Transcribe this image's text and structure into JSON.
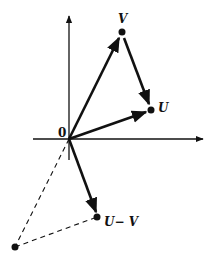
{
  "diagram": {
    "origin_label": "0",
    "points": [
      {
        "id": "V",
        "label": "V"
      },
      {
        "id": "U",
        "label": "U"
      },
      {
        "id": "UminusV",
        "label": "U− V"
      },
      {
        "id": "minusV",
        "label": ""
      }
    ],
    "colors": {
      "ink": "#111111",
      "background": "#ffffff"
    }
  }
}
